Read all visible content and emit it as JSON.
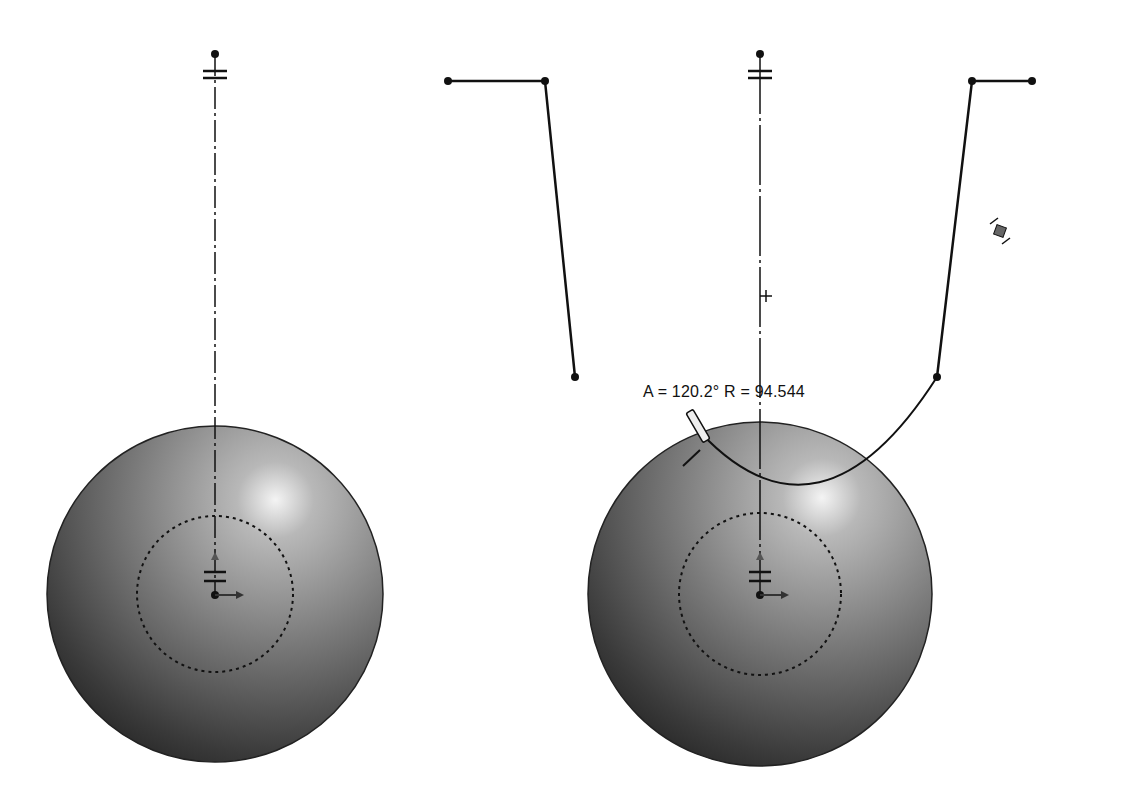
{
  "canvas": {
    "width": 1129,
    "height": 805,
    "background": "#ffffff"
  },
  "left_view": {
    "name": "sketch-before",
    "sphere": {
      "cx": 215,
      "cy": 594,
      "r": 168
    },
    "dotted_circle": {
      "cx": 215,
      "cy": 594,
      "r": 78
    },
    "centerline": {
      "x": 215,
      "y1": 54,
      "y2": 594
    },
    "top_constraint_y": 74,
    "bottom_constraint_y": 548,
    "profile": {
      "points": [
        [
          448,
          81
        ],
        [
          545,
          81
        ],
        [
          575,
          377
        ]
      ]
    }
  },
  "right_view": {
    "name": "sketch-after",
    "sphere": {
      "cx": 760,
      "cy": 594,
      "r": 172
    },
    "dotted_circle": {
      "cx": 760,
      "cy": 594,
      "r": 81
    },
    "centerline": {
      "x": 760,
      "y1": 54,
      "y2": 594
    },
    "top_constraint_y": 74,
    "bottom_constraint_y": 548,
    "profile": {
      "points": [
        [
          1032,
          81
        ],
        [
          972,
          81
        ],
        [
          937,
          377
        ]
      ]
    },
    "arc_start": [
      705,
      435
    ],
    "arc_end": [
      937,
      377
    ],
    "midpoint_marker": [
      1000,
      231
    ],
    "cursor_crosshair": [
      766,
      296
    ],
    "dimension_label": "A = 120.2° R = 94.544"
  },
  "colors": {
    "line": "#111111",
    "sphere_light": "#f2f2f2",
    "sphere_dark": "#1e1e1e"
  }
}
